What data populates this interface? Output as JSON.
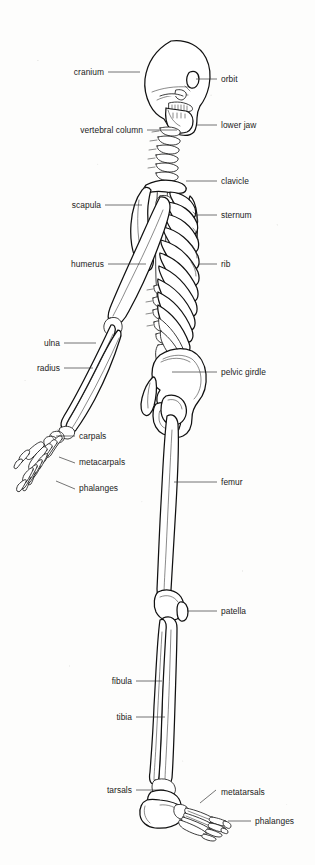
{
  "figure": {
    "view": "right lateral profile",
    "background_color": "#fdfdfc",
    "line_color": "#111111",
    "label_color": "#1b1b1b"
  },
  "labels": [
    {
      "id": "cranium",
      "text": "cranium",
      "side": "left",
      "text_x": 104,
      "text_y": 75,
      "line": [
        108,
        72,
        140,
        72
      ]
    },
    {
      "id": "orbit",
      "text": "orbit",
      "side": "right",
      "text_x": 221,
      "text_y": 82,
      "line": [
        196,
        79,
        217,
        79
      ]
    },
    {
      "id": "vertebral-column",
      "text": "vertebral column",
      "side": "left",
      "text_x": 143,
      "text_y": 133,
      "line": [
        147,
        130,
        177,
        130
      ]
    },
    {
      "id": "lower-jaw",
      "text": "lower jaw",
      "side": "right",
      "text_x": 221,
      "text_y": 128,
      "line": [
        196,
        125,
        217,
        125
      ]
    },
    {
      "id": "clavicle",
      "text": "clavicle",
      "side": "right",
      "text_x": 221,
      "text_y": 184,
      "line": [
        186,
        181,
        217,
        181
      ]
    },
    {
      "id": "scapula",
      "text": "scapula",
      "side": "left",
      "text_x": 101,
      "text_y": 208,
      "line": [
        105,
        205,
        142,
        205
      ]
    },
    {
      "id": "sternum",
      "text": "sternum",
      "side": "right",
      "text_x": 221,
      "text_y": 218,
      "line": [
        196,
        215,
        217,
        215
      ]
    },
    {
      "id": "humerus",
      "text": "humerus",
      "side": "left",
      "text_x": 104,
      "text_y": 267,
      "line": [
        108,
        264,
        146,
        264
      ]
    },
    {
      "id": "rib",
      "text": "rib",
      "side": "right",
      "text_x": 221,
      "text_y": 267,
      "line": [
        199,
        264,
        217,
        264
      ]
    },
    {
      "id": "ulna",
      "text": "ulna",
      "side": "left",
      "text_x": 60,
      "text_y": 346,
      "line": [
        64,
        343,
        96,
        343
      ]
    },
    {
      "id": "radius",
      "text": "radius",
      "side": "left",
      "text_x": 60,
      "text_y": 371,
      "line": [
        64,
        368,
        93,
        368
      ]
    },
    {
      "id": "pelvic-girdle",
      "text": "pelvic girdle",
      "side": "right",
      "text_x": 221,
      "text_y": 375,
      "line": [
        172,
        372,
        217,
        372
      ]
    },
    {
      "id": "carpals",
      "text": "carpals",
      "side": "right",
      "text_x": 79,
      "text_y": 439,
      "line": [
        56,
        436,
        75,
        436
      ]
    },
    {
      "id": "metacarpals",
      "text": "metacarpals",
      "side": "right",
      "text_x": 79,
      "text_y": 465,
      "line": [
        59,
        457,
        75,
        463
      ]
    },
    {
      "id": "femur",
      "text": "femur",
      "side": "right",
      "text_x": 221,
      "text_y": 485,
      "line": [
        174,
        482,
        217,
        482
      ]
    },
    {
      "id": "phalanges-hand",
      "text": "phalanges",
      "side": "right",
      "text_x": 79,
      "text_y": 491,
      "line": [
        56,
        481,
        75,
        489
      ]
    },
    {
      "id": "patella",
      "text": "patella",
      "side": "right",
      "text_x": 221,
      "text_y": 614,
      "line": [
        187,
        611,
        217,
        611
      ]
    },
    {
      "id": "fibula",
      "text": "fibula",
      "side": "left",
      "text_x": 132,
      "text_y": 684,
      "line": [
        136,
        681,
        162,
        681
      ]
    },
    {
      "id": "tibia",
      "text": "tibia",
      "side": "left",
      "text_x": 132,
      "text_y": 720,
      "line": [
        136,
        717,
        165,
        717
      ]
    },
    {
      "id": "tarsals",
      "text": "tarsals",
      "side": "left",
      "text_x": 132,
      "text_y": 793,
      "line": [
        136,
        790,
        164,
        790
      ]
    },
    {
      "id": "metatarsals",
      "text": "metatarsals",
      "side": "right",
      "text_x": 221,
      "text_y": 795,
      "line": [
        200,
        803,
        216,
        790
      ]
    },
    {
      "id": "phalanges-foot",
      "text": "phalanges",
      "side": "right",
      "text_x": 255,
      "text_y": 824,
      "line": [
        228,
        821,
        251,
        821
      ]
    }
  ],
  "bone_groups": [
    "cranium",
    "orbit",
    "lower jaw",
    "vertebral column",
    "clavicle",
    "scapula",
    "sternum",
    "ribs",
    "humerus",
    "ulna",
    "radius",
    "carpals",
    "metacarpals",
    "phalanges",
    "pelvic girdle",
    "femur",
    "patella",
    "tibia",
    "fibula",
    "tarsals",
    "metatarsals"
  ]
}
